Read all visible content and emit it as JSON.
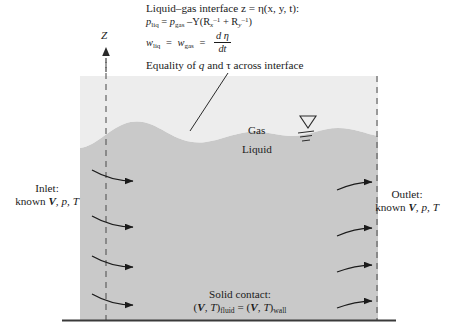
{
  "diagram": {
    "title_note": "Liquid–gas interface control volume with boundary conditions",
    "axis": {
      "label": "Z",
      "direction": "up"
    },
    "interface_annotation": {
      "line1": "Liquid–gas interface z = η(x, y, t):",
      "line2_lhs": "p",
      "line2_lhs_sub": "liq",
      "line2_eq": "=",
      "line2_rhs": "p",
      "line2_rhs_sub": "gas",
      "line2_tail_minus": "–Y(R",
      "line2_sub_x": "x",
      "line2_sup_1": "–1",
      "line2_plus": "+ R",
      "line2_sub_y": "y",
      "line2_sup_2": "–1",
      "line2_close": ")",
      "line3_lhs": "w",
      "line3_lhs_sub": "liq",
      "line3_eq1": "=",
      "line3_mid": "w",
      "line3_mid_sub": "gas",
      "line3_eq2": "=",
      "line3_frac_num": "d η",
      "line3_frac_den": "dt",
      "line4": "Equality of q and τ across interface",
      "line4_pre": "Equality of",
      "line4_q": "q",
      "line4_and": "and",
      "line4_tau": "τ",
      "line4_post": "across interface"
    },
    "region_labels": {
      "gas": "Gas",
      "liquid": "Liquid"
    },
    "free_surface_symbol": "free-surface-triangle",
    "inlet": {
      "line1": "Inlet:",
      "line2_pre": "known",
      "line2_v": "V",
      "line2_rest": ", p, T"
    },
    "outlet": {
      "line1": "Outlet:",
      "line2_pre": "known",
      "line2_v": "V",
      "line2_rest": ", p, T"
    },
    "solid_contact": {
      "line1": "Solid contact:",
      "line2_open": "(",
      "line2_v": "V",
      "line2_comma": ", ",
      "line2_t": "T",
      "line2_close": ")",
      "line2_sub1": "fluid",
      "line2_eq": "=",
      "line2_open2": "(",
      "line2_v2": "V",
      "line2_t2": "T",
      "line2_close2": ")",
      "line2_sub2": "wall"
    },
    "colors": {
      "liquid_fill": "#c9c9c9",
      "gas_fill": "#e3e3e3",
      "ink": "#1b1b1b",
      "dash": "#555555",
      "background": "#ffffff"
    },
    "geometry": {
      "box_left": 80,
      "box_right": 378,
      "box_top": 76,
      "box_bottom": 320,
      "dashed_left_x": 106,
      "dashed_right_x": 377,
      "inlet_arrow_rows": [
        178,
        224,
        262,
        300
      ],
      "outlet_arrow_rows": [
        182,
        228,
        266,
        302
      ]
    }
  }
}
